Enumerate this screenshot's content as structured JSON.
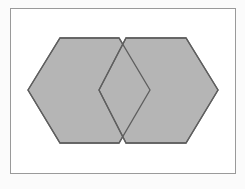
{
  "figure": {
    "canvas": {
      "width": 245,
      "height": 189,
      "background": "#fbfbfb"
    },
    "frame": {
      "x": 10,
      "y": 8,
      "width": 226,
      "height": 166,
      "fill": "#ffffff",
      "border_color": "#9a9a9a",
      "border_width": 1
    },
    "colors": {
      "hexagon_fill": "#b5b5b5",
      "hexagon_stroke": "#5f5f5f",
      "frame_border": "#9a9a9a",
      "page_background": "#fbfbfb"
    },
    "shapes": [
      {
        "name": "left-hexagon",
        "type": "polygon",
        "points": [
          [
            28,
            90
          ],
          [
            60,
            38
          ],
          [
            119,
            38
          ],
          [
            150,
            90
          ],
          [
            119,
            143
          ],
          [
            60,
            143
          ]
        ],
        "fill": "#b5b5b5",
        "stroke": "#5f5f5f",
        "stroke_width": 1.3
      },
      {
        "name": "right-hexagon",
        "type": "polygon",
        "points": [
          [
            99,
            90
          ],
          [
            126,
            38
          ],
          [
            186,
            38
          ],
          [
            218,
            90
          ],
          [
            186,
            143
          ],
          [
            126,
            143
          ]
        ],
        "fill": "#b5b5b5",
        "stroke": "#5f5f5f",
        "stroke_width": 1.3
      }
    ],
    "overlap_note": "overlap region is a rhombus; outlines of both hexagons remain visible"
  }
}
